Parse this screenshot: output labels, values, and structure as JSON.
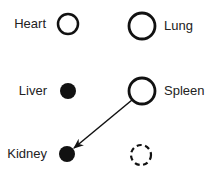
{
  "diagram": {
    "type": "organ-node-diagram",
    "colors": {
      "stroke": "#111111",
      "fill": "#111111",
      "text": "#222222",
      "background": "#ffffff"
    },
    "nodes": [
      {
        "id": "heart",
        "label": "Heart",
        "shape": "open-circle",
        "size": "small",
        "cx": 68,
        "cy": 24,
        "r": 10
      },
      {
        "id": "lung",
        "label": "Lung",
        "shape": "open-circle",
        "size": "large",
        "cx": 142,
        "cy": 26,
        "r": 13
      },
      {
        "id": "liver",
        "label": "Liver",
        "shape": "filled-circle",
        "size": "small",
        "cx": 68,
        "cy": 91,
        "r": 8
      },
      {
        "id": "spleen",
        "label": "Spleen",
        "shape": "open-circle",
        "size": "large",
        "cx": 142,
        "cy": 91,
        "r": 13
      },
      {
        "id": "kidney",
        "label": "Kidney",
        "shape": "filled-circle",
        "size": "small",
        "cx": 67,
        "cy": 154,
        "r": 8
      },
      {
        "id": "unlabeled",
        "label": "",
        "shape": "dashed-circle",
        "size": "small",
        "cx": 141,
        "cy": 155,
        "r": 10
      }
    ],
    "edges": [
      {
        "from": "spleen",
        "to": "kidney",
        "directed": true
      }
    ]
  }
}
